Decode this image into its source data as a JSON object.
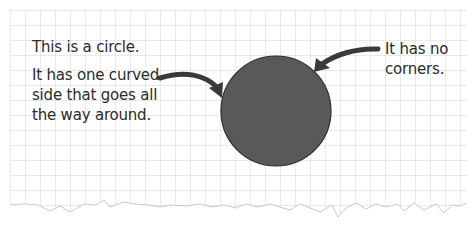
{
  "diagram": {
    "shape": "circle",
    "circle_fill": "#555555",
    "circle_stroke": "#333333",
    "grid_color": "#d6d6d6",
    "paper_color": "#ffffff"
  },
  "labels": {
    "title": "This is a circle.",
    "curved_side_line1": "It has one curved",
    "curved_side_line2": "side that goes all",
    "curved_side_line3": "the way around.",
    "corners_line1": "It has no",
    "corners_line2": "corners."
  }
}
